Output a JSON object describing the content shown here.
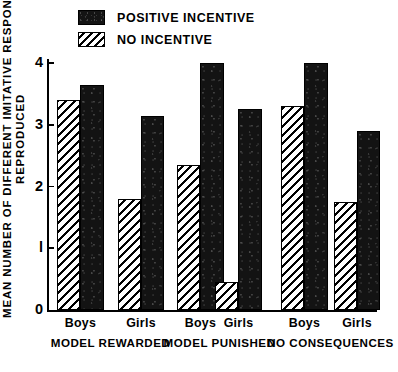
{
  "chart_data": {
    "type": "bar",
    "title": "",
    "subtitle": "",
    "xlabel": "",
    "ylabel": "MEAN NUMBER OF DIFFERENT IMITATIVE RESPONSES",
    "ylabel_line2": "REPRODUCED",
    "ylim": [
      0,
      4
    ],
    "ytick_labels": [
      "0",
      "l",
      "2",
      "3",
      "4"
    ],
    "ytick_values": [
      0,
      1,
      2,
      3,
      4
    ],
    "grid": false,
    "legend_position": "top-left",
    "categories": [
      "Boys",
      "Girls",
      "Boys",
      "Girls",
      "Boys",
      "Girls"
    ],
    "groups": [
      {
        "label": "MODEL REWARDED",
        "subcategories": [
          "Boys",
          "Girls"
        ]
      },
      {
        "label": "MODEL PUNISHED",
        "subcategories": [
          "Boys",
          "Girls"
        ]
      },
      {
        "label": "NO CONSEQUENCES",
        "subcategories": [
          "Boys",
          "Girls"
        ]
      }
    ],
    "series": [
      {
        "name": "NO INCENTIVE",
        "fill": "hatched",
        "color": "#ffffff",
        "values": [
          3.4,
          1.8,
          2.35,
          0.45,
          3.3,
          1.75
        ]
      },
      {
        "name": "POSITIVE INCENTIVE",
        "fill": "solid",
        "color": "#131313",
        "values": [
          3.65,
          3.15,
          4.0,
          3.25,
          4.0,
          2.9
        ]
      }
    ],
    "bars": [
      {
        "group": "MODEL REWARDED",
        "sub": "Boys",
        "series": "NO INCENTIVE",
        "value": 3.4,
        "x": 57,
        "w": 23
      },
      {
        "group": "MODEL REWARDED",
        "sub": "Boys",
        "series": "POSITIVE INCENTIVE",
        "value": 3.65,
        "x": 80,
        "w": 24
      },
      {
        "group": "MODEL REWARDED",
        "sub": "Girls",
        "series": "NO INCENTIVE",
        "value": 1.8,
        "x": 118,
        "w": 23
      },
      {
        "group": "MODEL REWARDED",
        "sub": "Girls",
        "series": "POSITIVE INCENTIVE",
        "value": 3.15,
        "x": 141,
        "w": 23
      },
      {
        "group": "MODEL PUNISHED",
        "sub": "Boys",
        "series": "NO INCENTIVE",
        "value": 2.35,
        "x": 177,
        "w": 23
      },
      {
        "group": "MODEL PUNISHED",
        "sub": "Boys",
        "series": "POSITIVE INCENTIVE",
        "value": 4.0,
        "x": 200,
        "w": 24
      },
      {
        "group": "MODEL PUNISHED",
        "sub": "Girls",
        "series": "NO INCENTIVE",
        "value": 0.45,
        "x": 215,
        "w": 23
      },
      {
        "group": "MODEL PUNISHED",
        "sub": "Girls",
        "series": "POSITIVE INCENTIVE",
        "value": 3.25,
        "x": 238,
        "w": 24
      },
      {
        "group": "NO CONSEQUENCES",
        "sub": "Boys",
        "series": "NO INCENTIVE",
        "value": 3.3,
        "x": 281,
        "w": 23
      },
      {
        "group": "NO CONSEQUENCES",
        "sub": "Boys",
        "series": "POSITIVE INCENTIVE",
        "value": 4.0,
        "x": 304,
        "w": 24
      },
      {
        "group": "NO CONSEQUENCES",
        "sub": "Girls",
        "series": "NO INCENTIVE",
        "value": 1.75,
        "x": 334,
        "w": 23
      },
      {
        "group": "NO CONSEQUENCES",
        "sub": "Girls",
        "series": "POSITIVE INCENTIVE",
        "value": 2.9,
        "x": 357,
        "w": 23
      }
    ]
  },
  "legend": {
    "items": [
      {
        "label": "POSITIVE INCENTIVE",
        "swatch": "solid"
      },
      {
        "label": "NO INCENTIVE",
        "swatch": "hatch"
      }
    ]
  },
  "axes": {
    "y_title_line1": "MEAN NUMBER OF DIFFERENT IMITATIVE RESPONSES",
    "y_title_line2": "REPRODUCED",
    "y_ticks": [
      {
        "label": "4",
        "value": 4
      },
      {
        "label": "3",
        "value": 3
      },
      {
        "label": "2",
        "value": 2
      },
      {
        "label": "l",
        "value": 1
      },
      {
        "label": "0",
        "value": 0
      }
    ]
  },
  "x_axis": {
    "sub_labels": [
      "Boys",
      "Girls",
      "Boys",
      "Girls",
      "Boys",
      "Girls"
    ],
    "group_labels": [
      "MODEL  REWARDED",
      "MODEL  PUNISHED",
      "NO  CONSEQUENCES"
    ]
  }
}
